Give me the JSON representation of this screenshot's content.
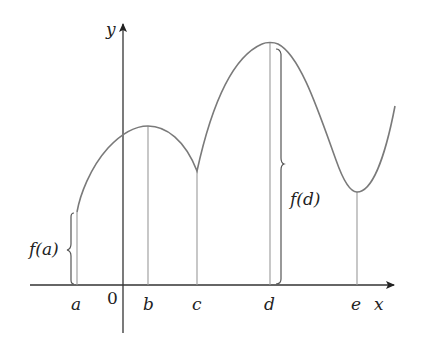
{
  "diagram": {
    "type": "function-graph",
    "axes": {
      "x_label": "x",
      "y_label": "y",
      "origin_label": "0"
    },
    "points": [
      {
        "label": "a",
        "role": "left endpoint"
      },
      {
        "label": "b",
        "role": "local maximum"
      },
      {
        "label": "c",
        "role": "cusp / local minimum"
      },
      {
        "label": "d",
        "role": "absolute maximum"
      },
      {
        "label": "e",
        "role": "local minimum"
      }
    ],
    "annotations": [
      {
        "text": "f(a)",
        "brace_for": "a"
      },
      {
        "text": "f(d)",
        "brace_for": "d"
      }
    ],
    "colors": {
      "curve": "#7a7a7a",
      "axes": "#222222",
      "guides": "#9a9a9a",
      "braces": "#555555"
    }
  }
}
